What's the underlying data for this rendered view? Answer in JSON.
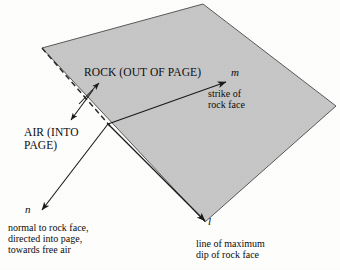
{
  "figure": {
    "panel_id": "(b)",
    "plane_fill_color": "#c6c6c6",
    "plane_edge_color": "#3a3a3a",
    "background_color": "#fdfdfc",
    "line_color": "#1a1a1a"
  },
  "labels": {
    "rock": "ROCK (OUT OF PAGE)",
    "air_line1": "AIR (INTO",
    "air_line2": "PAGE)",
    "air": "AIR (INTO\nPAGE)",
    "vector_m": "m",
    "strike_line1": "strike of",
    "strike_line2": "rock face",
    "strike": "strike of\nrock face",
    "vector_n": "n",
    "normal_line1": "normal to rock face,",
    "normal_line2": "directed into page,",
    "normal_line3": "towards free air",
    "normal": "normal to rock face,\ndirected into page,\ntowards free air",
    "vector_l": "l",
    "dip_line1": "line of maximum",
    "dip_line2": "dip of rock face",
    "dip": "line of maximum\ndip of rock face"
  },
  "geometry": {
    "plane_vertices": "42,48 203,4 336,106 205,222",
    "dashed_edge": "42,48 108,124",
    "strike_arrow": {
      "x1": 108,
      "y1": 124,
      "x2": 227,
      "y2": 82
    },
    "dip_arrow": {
      "x1": 108,
      "y1": 124,
      "x2": 206,
      "y2": 222
    },
    "normal_arrow": {
      "x1": 108,
      "y1": 124,
      "x2": 41,
      "y2": 211
    },
    "rock_arrow": {
      "x1": 80,
      "y1": 103,
      "x2": 99,
      "y2": 82
    },
    "air_arrow": {
      "x1": 93,
      "y1": 91,
      "x2": 70,
      "y2": 121
    }
  }
}
